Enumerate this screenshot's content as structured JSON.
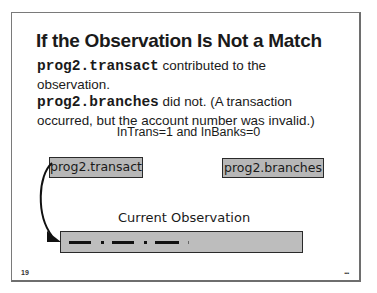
{
  "slide": {
    "title": "If the Observation Is Not a Match",
    "body": {
      "line1_code": "prog2.transact",
      "line1_text": " contributed to the observation.",
      "line2_code": "prog2.branches",
      "line2_text": " did not. (A transaction occurred, but the account number was invalid.)"
    },
    "condition": "InTrans=1 and InBanks=0",
    "diagram": {
      "source_left": "prog2.transact",
      "source_right": "prog2.branches",
      "observation_label": "Current Observation"
    },
    "footer": {
      "page_number": "19",
      "more_indicator": "..."
    }
  },
  "colors": {
    "box_fill": "#b7b7b7",
    "bar_fill": "#bdbdbd",
    "border": "#2a2a2a",
    "text": "#1a1a1a"
  }
}
